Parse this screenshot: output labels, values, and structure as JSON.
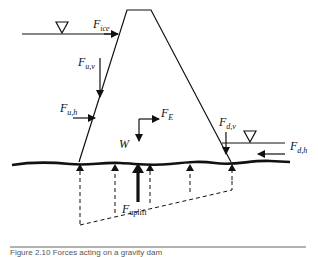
{
  "figure": {
    "title": "Forces acting on a gravity dam",
    "caption_partial": "Figure 2.10  Forces acting on a gravity dam",
    "labels": {
      "ice": {
        "main": "F",
        "sub": "ice"
      },
      "upstream_vertical": {
        "main": "F",
        "sub": "u,v"
      },
      "upstream_horizontal": {
        "main": "F",
        "sub": "u,h"
      },
      "earthquake": {
        "main": "F",
        "sub": "E"
      },
      "weight": {
        "main": "W"
      },
      "downstream_vertical": {
        "main": "F",
        "sub": "d,v"
      },
      "downstream_horizontal": {
        "main": "F",
        "sub": "d,h"
      },
      "uplift": {
        "main": "F",
        "sub": "uplift"
      }
    },
    "symbols": {
      "upstream_water_level": "water-level-triangle",
      "downstream_water_level": "water-level-triangle"
    },
    "colors": {
      "line": "#111111",
      "background": "#ffffff",
      "separator": "#666666"
    }
  }
}
